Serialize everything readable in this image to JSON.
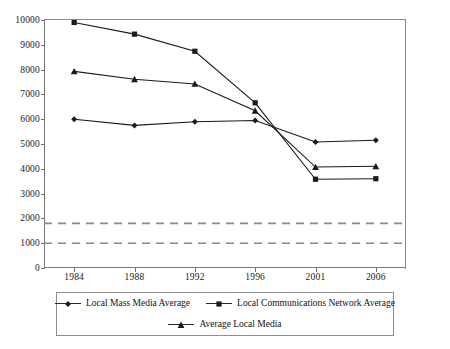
{
  "chart_data": {
    "type": "line",
    "title": "",
    "subtitle": "",
    "xlabel": "",
    "ylabel": "",
    "categories": [
      "1984",
      "1988",
      "1992",
      "1996",
      "2001",
      "2006"
    ],
    "x": [
      1984,
      1988,
      1992,
      1996,
      2001,
      2006
    ],
    "ylim": [
      0,
      10000
    ],
    "xlim_categorical": true,
    "ytick_values": [
      0,
      1000,
      2000,
      3000,
      4000,
      5000,
      6000,
      7000,
      8000,
      9000,
      10000
    ],
    "ytick_labels": [
      "0",
      "1000",
      "2000",
      "3000",
      "4000",
      "5000",
      "6000",
      "7000",
      "8000",
      "9000",
      "10000"
    ],
    "grid": false,
    "legend_position": "bottom",
    "series": [
      {
        "name": "Local Mass Media Average",
        "marker": "diamond",
        "color": "#1a1a1a",
        "values": [
          6000,
          5750,
          5900,
          5950,
          5080,
          5150
        ]
      },
      {
        "name": "Local Communications Network Average",
        "marker": "square",
        "color": "#1a1a1a",
        "values": [
          9900,
          9430,
          8740,
          6660,
          3580,
          3600
        ]
      },
      {
        "name": "Average Local Media",
        "marker": "triangle",
        "color": "#1a1a1a",
        "values": [
          7930,
          7610,
          7420,
          6340,
          4070,
          4100
        ]
      }
    ],
    "reference_lines": [
      {
        "name": "upper-reference-line",
        "value": 1800,
        "style": "dashed",
        "color": "#8a8a8a"
      },
      {
        "name": "lower-reference-line",
        "value": 1000,
        "style": "dashed",
        "color": "#8a8a8a"
      }
    ],
    "axis_color": "#7a7a7a",
    "background": "#ffffff"
  },
  "legend": {
    "rows": [
      [
        {
          "label": "Local Mass Media Average",
          "marker": "diamond"
        },
        {
          "label": "Local Communications Network Average",
          "marker": "square"
        }
      ],
      [
        {
          "label": "Average Local Media",
          "marker": "triangle"
        }
      ]
    ]
  }
}
